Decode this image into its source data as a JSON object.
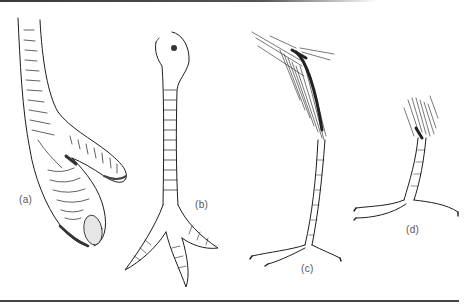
{
  "figure": {
    "panels": [
      {
        "id": "a",
        "label": "(a)",
        "subject": "bird foot with two toes, close-up, scaled skin"
      },
      {
        "id": "b",
        "label": "(b)",
        "subject": "bird leg with three forward-pointing toes, scaled tarsus"
      },
      {
        "id": "c",
        "label": "(c)",
        "subject": "long thin bird leg with feathered thigh and four-toed foot"
      },
      {
        "id": "d",
        "label": "(d)",
        "subject": "short bird leg with feathered tuft and curved-claw toes"
      }
    ],
    "colors": {
      "ink": "#1e1e1e",
      "label": "#555555",
      "background": "#ffffff",
      "rule": "#444444"
    }
  }
}
